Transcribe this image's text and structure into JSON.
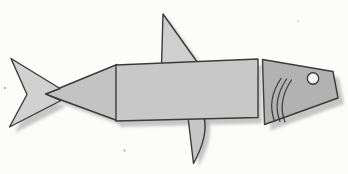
{
  "figure": {
    "canvas": {
      "width": 348,
      "height": 174
    },
    "background_color": "#fcfcfb",
    "outline_color": "#3b3b3b",
    "shadow": {
      "color": "#b4b4b4",
      "opacity": 0.75,
      "blur": 1.6
    },
    "palette": {
      "light_gray": "#d1d1d1",
      "mid_gray": "#c7c7c7",
      "dark_gray": "#b2b2b2",
      "eye_white": "#f6f6f6"
    },
    "elements": [
      {
        "name": "dorsal-fin",
        "type": "polygon",
        "points": "163,14 161.5,66 200,66",
        "fill": "#cfcfcf",
        "stroke": true,
        "stroke_width": 1.4,
        "shadow": [
          4,
          3
        ]
      },
      {
        "name": "pelvic-fin",
        "type": "path",
        "d": "M 188 117 L 204 117.5 C 207.5 131 203 146 193.5 163.5 Z",
        "fill": "#c6c6c6",
        "stroke": true,
        "stroke_width": 1.4,
        "shadow": [
          5,
          3
        ]
      },
      {
        "name": "body-front-triangle",
        "type": "polygon",
        "points": "45,94 117,64.5 117,120.5",
        "fill": "#c3c3c3",
        "stroke": true,
        "stroke_width": 1.4,
        "shadow": [
          5,
          5
        ]
      },
      {
        "name": "tail",
        "type": "polygon",
        "points": "11,58.5 60,88.5 45.5,94 61,100.5 9.5,127 27,94.5",
        "fill": "#d1d1d1",
        "stroke": true,
        "stroke_width": 1.4,
        "shadow": [
          5,
          6
        ]
      },
      {
        "name": "body-rectangle",
        "type": "polygon",
        "points": "116,65 258,59 258,117.5 116,121",
        "fill": "#c8c8c8",
        "stroke": true,
        "stroke_width": 1.4,
        "shadow": [
          4,
          6
        ]
      },
      {
        "name": "head",
        "type": "polygon",
        "points": "262.5,59.5 333,71.5 338,98 264.5,124.5",
        "fill": "#b2b2b2",
        "stroke": true,
        "stroke_width": 1.4,
        "shadow": [
          6,
          6
        ]
      },
      {
        "name": "gill-line-1",
        "type": "path",
        "d": "M 281 78.5 Q 266.5 100 274.5 121",
        "fill": "none",
        "stroke": true,
        "stroke_width": 1.2
      },
      {
        "name": "gill-line-2",
        "type": "path",
        "d": "M 286.5 79 Q 272 101 280 121.5",
        "fill": "none",
        "stroke": true,
        "stroke_width": 1.2
      },
      {
        "name": "gill-line-3",
        "type": "path",
        "d": "M 291.5 80 Q 277 101.5 285 122",
        "fill": "none",
        "stroke": true,
        "stroke_width": 1.2
      },
      {
        "name": "eye",
        "type": "circle",
        "cx": 313,
        "cy": 78.5,
        "r": 5.7,
        "fill": "#f6f6f6",
        "stroke": true,
        "stroke_width": 1.4
      },
      {
        "name": "speck-1",
        "type": "circle",
        "cx": 5,
        "cy": 88,
        "r": 0.9,
        "fill": "#9a9a9a"
      },
      {
        "name": "speck-2",
        "type": "circle",
        "cx": 124.5,
        "cy": 150.5,
        "r": 0.9,
        "fill": "#9a9a9a"
      },
      {
        "name": "speck-3",
        "type": "circle",
        "cx": 298,
        "cy": 21,
        "r": 0.8,
        "fill": "#b0b0b0"
      }
    ]
  }
}
